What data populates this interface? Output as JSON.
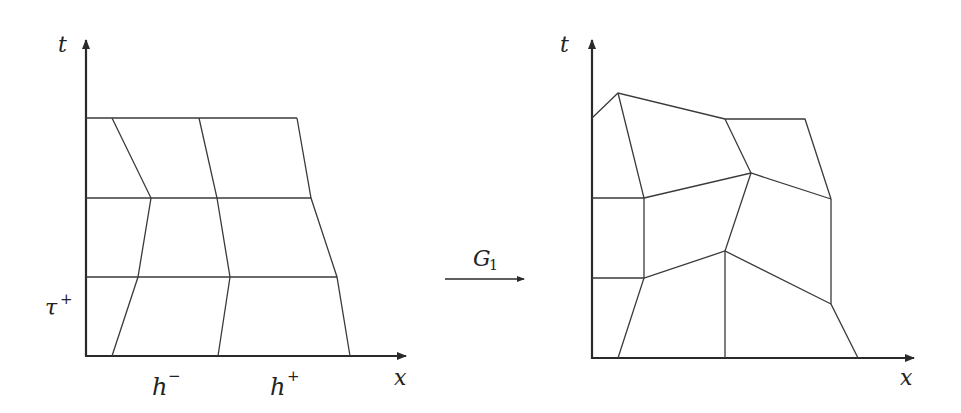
{
  "figure": {
    "left_panel": {
      "axis_labels": {
        "t": "t",
        "x": "x"
      },
      "tick_labels": {
        "tau": "τ",
        "tau_sup": "+",
        "h_minus": "h",
        "h_minus_sup": "−",
        "h_plus": "h",
        "h_plus_sup": "+"
      },
      "description": "Regular mesh of quadrilateral cells in (x,t) plane with 3 horizontal time levels and 3 slanted vertical lines"
    },
    "mapping_arrow": {
      "label": "G",
      "label_sub": "1"
    },
    "right_panel": {
      "axis_labels": {
        "t": "t",
        "x": "x"
      },
      "description": "Deformed mesh: image of left mesh under map G1"
    },
    "colors": {
      "line": "#3a3a3a",
      "axis": "#2a2a2a",
      "background": "#ffffff"
    }
  }
}
